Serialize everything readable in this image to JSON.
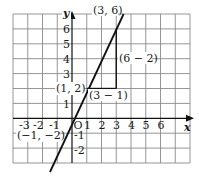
{
  "figure": {
    "x_axis_label": "x",
    "y_axis_label": "y",
    "origin_label": "O",
    "x_ticks": [
      "-3",
      "-2",
      "-1",
      "1",
      "2",
      "3",
      "4",
      "5",
      "6"
    ],
    "y_ticks": [
      "6",
      "5",
      "4",
      "3",
      "1",
      "-1",
      "-2"
    ],
    "points": [
      {
        "label": "(3, 6)",
        "x": 3,
        "y": 6
      },
      {
        "label": "(1, 2)",
        "x": 1,
        "y": 2
      },
      {
        "label": "(−1, −2)",
        "x": -1,
        "y": -2
      }
    ],
    "annotations": {
      "rise": "(6 − 2)",
      "run": "(3 − 1)"
    },
    "line": {
      "slope": 2,
      "intercept": 0
    },
    "grid": {
      "x_min": -4,
      "x_max": 8,
      "y_min": -3,
      "y_max": 7
    },
    "colors": {
      "grid": "#8a8a8a",
      "line": "#111111",
      "axis": "#111111"
    }
  }
}
